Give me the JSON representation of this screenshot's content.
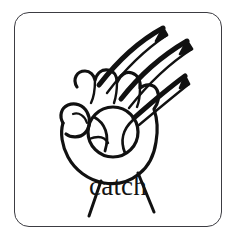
{
  "card": {
    "caption": "catch",
    "border_color": "#3c3c42",
    "background_color": "#ffffff",
    "ink_color": "#111111",
    "corner_radius_px": 15
  },
  "illustration": {
    "name": "hand-catching-ball-drawing",
    "description": "line drawing of an open hand catching a ball with motion arrows",
    "parts": [
      {
        "name": "hand",
        "label": "hand"
      },
      {
        "name": "ball",
        "label": "ball"
      },
      {
        "name": "motion-arrow-1",
        "label": "motion arrow"
      },
      {
        "name": "motion-arrow-2",
        "label": "motion arrow"
      },
      {
        "name": "motion-arrow-3",
        "label": "motion arrow"
      },
      {
        "name": "wrist-line-left",
        "label": "wrist line"
      },
      {
        "name": "wrist-line-right",
        "label": "wrist line"
      }
    ]
  }
}
